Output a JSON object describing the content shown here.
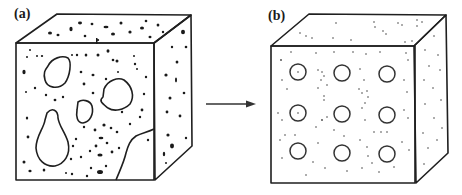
{
  "panels": [
    {
      "id": "a",
      "label": "(a)",
      "description": "porous cube with irregular large pores and scattered dark particles"
    },
    {
      "id": "b",
      "label": "(b)",
      "description": "cube with ordered 3x3 array of circular pores and fine dispersed dots"
    }
  ],
  "arrow": {
    "direction": "right",
    "meaning": "transformation from (a) to (b)"
  },
  "colors": {
    "stroke": "#1f1f1f",
    "background": "#ffffff",
    "particle": "#1a1a1a"
  },
  "cube_b_pores": {
    "rows": 3,
    "cols": 3
  }
}
